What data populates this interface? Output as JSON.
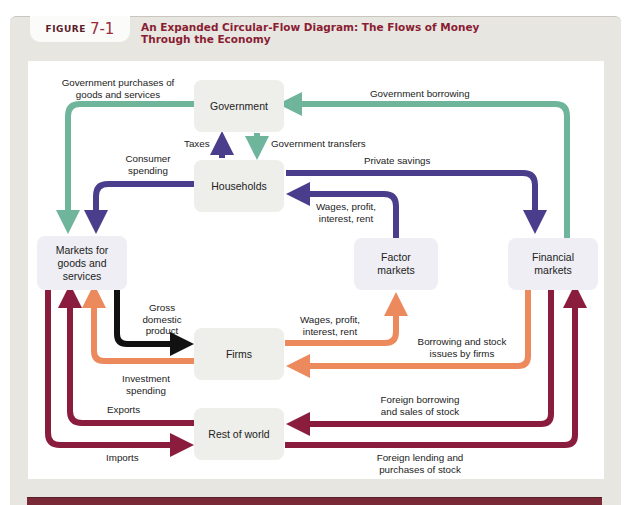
{
  "figure": {
    "label_word": "FIGURE",
    "label_number": "7-1",
    "title_line1": "An Expanded Circular-Flow Diagram: The Flows of Money",
    "title_line2": "Through the Economy"
  },
  "nodes": {
    "government": "Government",
    "households": "Households",
    "markets_goods_1": "Markets for",
    "markets_goods_2": "goods and",
    "markets_goods_3": "services",
    "factor_1": "Factor",
    "factor_2": "markets",
    "financial_1": "Financial",
    "financial_2": "markets",
    "firms": "Firms",
    "rest_of_world": "Rest of world"
  },
  "flows": {
    "gov_purchases_1": "Government purchases of",
    "gov_purchases_2": "goods and services",
    "gov_borrowing": "Government borrowing",
    "taxes": "Taxes",
    "gov_transfers": "Government transfers",
    "consumer_spending_1": "Consumer",
    "consumer_spending_2": "spending",
    "private_savings": "Private savings",
    "wages_hh_1": "Wages, profit,",
    "wages_hh_2": "interest, rent",
    "gdp_1": "Gross",
    "gdp_2": "domestic",
    "gdp_3": "product",
    "wages_firms_1": "Wages, profit,",
    "wages_firms_2": "interest, rent",
    "borrowing_firms_1": "Borrowing and stock",
    "borrowing_firms_2": "issues by firms",
    "investment_1": "Investment",
    "investment_2": "spending",
    "exports": "Exports",
    "foreign_borrowing_1": "Foreign borrowing",
    "foreign_borrowing_2": "and sales of stock",
    "imports": "Imports",
    "foreign_lending_1": "Foreign lending and",
    "foreign_lending_2": "purchases of stock"
  },
  "colors": {
    "government_flows": "#6fb59c",
    "household_flows": "#4a3d8c",
    "firm_flows": "#ec8a5e",
    "foreign_flows": "#8a1d3e",
    "gdp_flow": "#111111",
    "title": "#8a1d33"
  }
}
